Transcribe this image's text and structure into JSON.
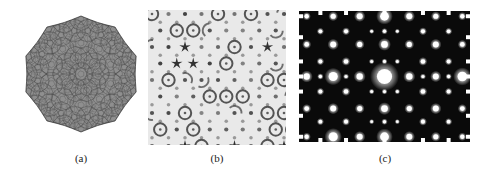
{
  "figure": {
    "background_color": "#ffffff",
    "width": 482,
    "height": 180,
    "panel_count": 3
  },
  "captions": {
    "a": "(a)",
    "b": "(b)",
    "c": "(c)"
  },
  "panels": [
    {
      "id": "a",
      "label": "(a)",
      "type": "tiling-cluster-illustration",
      "description": "Gray quasicrystal tiling cluster with ten-fold symmetry and spiky perimeter",
      "bounds": {
        "x": 22,
        "y": 12,
        "width": 118,
        "height": 126
      },
      "fill_color": "#8f8f8f",
      "stroke_color": "#4a4a4a",
      "symmetry_order": 10,
      "background_color": "#ffffff"
    },
    {
      "id": "b",
      "label": "(b)",
      "type": "hrtem-micrograph",
      "description": "High resolution electron micrograph showing dark dots, ring motifs and black star shapes in quasiperiodic arrangement",
      "bounds": {
        "x": 148,
        "y": 10,
        "width": 138,
        "height": 135
      },
      "background_color": "#e8e8e8",
      "dot_color": "#2b2b2b",
      "star_color": "#111111"
    },
    {
      "id": "c",
      "label": "(c)",
      "type": "electron-diffraction-pattern",
      "description": "Electron diffraction pattern of white spots on black background with a bright central beam",
      "bounds": {
        "x": 299,
        "y": 11,
        "width": 171,
        "height": 131
      },
      "background_color": "#0a0a0a",
      "spot_color": "#ffffff",
      "center_spot": {
        "x": 0.5,
        "y": 0.5,
        "radius": 7.5
      }
    }
  ],
  "chart_data": {
    "type": "scatter",
    "title": "",
    "xlabel": "",
    "ylabel": "",
    "panel_a_tiling": {
      "symmetry_order": 10,
      "ring_radii": [
        0,
        17,
        31,
        44,
        55
      ],
      "ring_counts": [
        1,
        10,
        10,
        20,
        20
      ],
      "spike_count": 10,
      "spike_radius": 58,
      "cluster_radius": 55
    },
    "panel_b_motifs": {
      "lattice_step_x": 16.5,
      "lattice_step_y": 16.5,
      "dot_radius": 2.1,
      "ring_outer_radius": 6.2,
      "ring_inner_radius": 3.2,
      "star_arm_count": 5,
      "star_radius": 6.0,
      "rows": 9,
      "cols": 9
    },
    "panel_c_spots": {
      "note": "Quasiperiodic diffraction spots, normalized coords and radius in px",
      "points": [
        {
          "x": 0.5,
          "y": 0.5,
          "r": 7.6
        },
        {
          "x": 0.5,
          "y": 0.255,
          "r": 3.4
        },
        {
          "x": 0.5,
          "y": 0.745,
          "r": 3.4
        },
        {
          "x": 0.5,
          "y": 0.04,
          "r": 4.4
        },
        {
          "x": 0.5,
          "y": 0.96,
          "r": 4.4
        },
        {
          "x": 0.5,
          "y": 0.385,
          "r": 1.6
        },
        {
          "x": 0.5,
          "y": 0.615,
          "r": 1.6
        },
        {
          "x": 0.5,
          "y": 0.155,
          "r": 1.7
        },
        {
          "x": 0.5,
          "y": 0.845,
          "r": 1.7
        },
        {
          "x": 0.355,
          "y": 0.5,
          "r": 3.2
        },
        {
          "x": 0.645,
          "y": 0.5,
          "r": 3.2
        },
        {
          "x": 0.2,
          "y": 0.5,
          "r": 4.6
        },
        {
          "x": 0.8,
          "y": 0.5,
          "r": 3.0
        },
        {
          "x": 0.045,
          "y": 0.5,
          "r": 3.2
        },
        {
          "x": 0.955,
          "y": 0.5,
          "r": 4.8
        },
        {
          "x": 0.275,
          "y": 0.5,
          "r": 1.6
        },
        {
          "x": 0.725,
          "y": 0.5,
          "r": 1.6
        },
        {
          "x": 0.125,
          "y": 0.5,
          "r": 1.7
        },
        {
          "x": 0.875,
          "y": 0.5,
          "r": 1.7
        },
        {
          "x": 0.355,
          "y": 0.255,
          "r": 2.6
        },
        {
          "x": 0.645,
          "y": 0.255,
          "r": 2.6
        },
        {
          "x": 0.355,
          "y": 0.745,
          "r": 2.6
        },
        {
          "x": 0.645,
          "y": 0.745,
          "r": 2.6
        },
        {
          "x": 0.2,
          "y": 0.255,
          "r": 3.0
        },
        {
          "x": 0.8,
          "y": 0.255,
          "r": 3.0
        },
        {
          "x": 0.2,
          "y": 0.745,
          "r": 3.0
        },
        {
          "x": 0.8,
          "y": 0.745,
          "r": 3.0
        },
        {
          "x": 0.045,
          "y": 0.255,
          "r": 2.4
        },
        {
          "x": 0.955,
          "y": 0.255,
          "r": 2.4
        },
        {
          "x": 0.045,
          "y": 0.745,
          "r": 2.4
        },
        {
          "x": 0.955,
          "y": 0.745,
          "r": 2.4
        },
        {
          "x": 0.355,
          "y": 0.04,
          "r": 3.0
        },
        {
          "x": 0.645,
          "y": 0.04,
          "r": 3.0
        },
        {
          "x": 0.355,
          "y": 0.96,
          "r": 3.0
        },
        {
          "x": 0.645,
          "y": 0.96,
          "r": 3.0
        },
        {
          "x": 0.2,
          "y": 0.04,
          "r": 2.6
        },
        {
          "x": 0.8,
          "y": 0.04,
          "r": 2.6
        },
        {
          "x": 0.2,
          "y": 0.96,
          "r": 4.6
        },
        {
          "x": 0.8,
          "y": 0.96,
          "r": 2.6
        },
        {
          "x": 0.045,
          "y": 0.04,
          "r": 2.2
        },
        {
          "x": 0.955,
          "y": 0.04,
          "r": 2.2
        },
        {
          "x": 0.045,
          "y": 0.96,
          "r": 2.2
        },
        {
          "x": 0.955,
          "y": 0.96,
          "r": 2.2
        },
        {
          "x": 0.275,
          "y": 0.385,
          "r": 2.3
        },
        {
          "x": 0.725,
          "y": 0.385,
          "r": 2.3
        },
        {
          "x": 0.275,
          "y": 0.615,
          "r": 2.3
        },
        {
          "x": 0.725,
          "y": 0.615,
          "r": 2.3
        },
        {
          "x": 0.125,
          "y": 0.385,
          "r": 2.0
        },
        {
          "x": 0.875,
          "y": 0.385,
          "r": 2.0
        },
        {
          "x": 0.125,
          "y": 0.615,
          "r": 2.0
        },
        {
          "x": 0.875,
          "y": 0.615,
          "r": 2.0
        },
        {
          "x": 0.275,
          "y": 0.155,
          "r": 2.1
        },
        {
          "x": 0.725,
          "y": 0.155,
          "r": 2.1
        },
        {
          "x": 0.275,
          "y": 0.845,
          "r": 2.1
        },
        {
          "x": 0.725,
          "y": 0.845,
          "r": 2.1
        },
        {
          "x": 0.125,
          "y": 0.155,
          "r": 1.9
        },
        {
          "x": 0.875,
          "y": 0.155,
          "r": 1.9
        },
        {
          "x": 0.125,
          "y": 0.845,
          "r": 1.9
        },
        {
          "x": 0.875,
          "y": 0.845,
          "r": 1.9
        },
        {
          "x": 0.425,
          "y": 0.385,
          "r": 1.5
        },
        {
          "x": 0.575,
          "y": 0.385,
          "r": 1.5
        },
        {
          "x": 0.425,
          "y": 0.615,
          "r": 1.5
        },
        {
          "x": 0.575,
          "y": 0.615,
          "r": 1.5
        },
        {
          "x": 0.425,
          "y": 0.155,
          "r": 1.4
        },
        {
          "x": 0.575,
          "y": 0.155,
          "r": 1.4
        },
        {
          "x": 0.425,
          "y": 0.845,
          "r": 1.4
        },
        {
          "x": 0.575,
          "y": 0.845,
          "r": 1.4
        }
      ],
      "edge_ticks": {
        "left_y": [
          0.04,
          0.2,
          0.385,
          0.5,
          0.615,
          0.8,
          0.96
        ],
        "right_y": [
          0.04,
          0.2,
          0.385,
          0.5,
          0.615,
          0.8,
          0.96
        ],
        "top_x": [
          0.125,
          0.275,
          0.5,
          0.725,
          0.875
        ],
        "bottom_x": [
          0.125,
          0.275,
          0.5,
          0.725,
          0.875
        ]
      }
    }
  }
}
